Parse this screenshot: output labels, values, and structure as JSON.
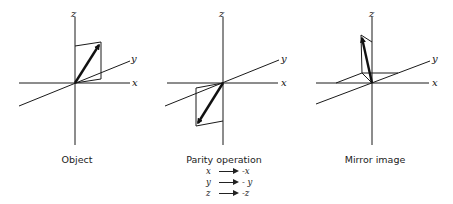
{
  "panels": [
    {
      "caption": "Object",
      "axes": {
        "x": "x",
        "y": "y",
        "z": "z"
      }
    },
    {
      "caption": "Parity operation",
      "axes": {
        "x": "x",
        "y": "y",
        "z": "z"
      },
      "rules": [
        {
          "from": "x",
          "to": "-x"
        },
        {
          "from": "y",
          "to": "- y"
        },
        {
          "from": "z",
          "to": "-z"
        }
      ]
    },
    {
      "caption": "Mirror image",
      "axes": {
        "x": "x",
        "y": "y",
        "z": "z"
      }
    }
  ],
  "colors": {
    "ink": "#1a1a1a",
    "background": "#ffffff"
  }
}
